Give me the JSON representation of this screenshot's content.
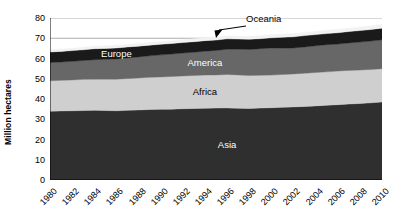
{
  "chart_data": {
    "type": "area",
    "title": "",
    "subtitle": "",
    "xlabel": "",
    "ylabel": "Million hectares",
    "stacked": true,
    "grid": true,
    "legend_position": "in-plot-labels",
    "xlim": [
      1980,
      2010
    ],
    "ylim": [
      0,
      80
    ],
    "y_ticks": [
      0,
      10,
      20,
      30,
      40,
      50,
      60,
      70,
      80
    ],
    "x_tick_labels": [
      "1980",
      "1982",
      "1984",
      "1986",
      "1988",
      "1990",
      "1992",
      "1994",
      "1996",
      "1998",
      "2000",
      "2002",
      "2004",
      "2006",
      "2008",
      "2010"
    ],
    "x_minor_tick_interval": 1,
    "x": [
      1980,
      1981,
      1982,
      1983,
      1984,
      1985,
      1986,
      1987,
      1988,
      1989,
      1990,
      1991,
      1992,
      1993,
      1994,
      1995,
      1996,
      1997,
      1998,
      1999,
      2000,
      2001,
      2002,
      2003,
      2004,
      2005,
      2006,
      2007,
      2008,
      2009,
      2010
    ],
    "series": [
      {
        "name": "Asia",
        "color": "#2f2f2f",
        "label_color": "#ffffff",
        "values": [
          34.0,
          34.1,
          34.2,
          34.3,
          34.4,
          34.3,
          34.2,
          34.4,
          34.6,
          34.8,
          34.9,
          35.0,
          35.2,
          35.3,
          35.4,
          35.5,
          35.6,
          35.4,
          35.3,
          35.5,
          35.7,
          35.9,
          36.1,
          36.3,
          36.6,
          36.9,
          37.2,
          37.5,
          37.8,
          38.1,
          38.5
        ]
      },
      {
        "name": "Africa",
        "color": "#cfcfcf",
        "label_color": "#000000",
        "values": [
          15.0,
          15.1,
          15.2,
          15.4,
          15.4,
          15.5,
          15.6,
          15.7,
          15.8,
          15.9,
          16.0,
          16.1,
          16.2,
          16.3,
          16.4,
          16.4,
          16.5,
          16.5,
          16.3,
          16.2,
          16.1,
          16.2,
          16.3,
          16.4,
          16.5,
          16.5,
          16.6,
          16.6,
          16.5,
          16.5,
          16.5
        ]
      },
      {
        "name": "America",
        "color": "#676767",
        "label_color": "#ffffff",
        "values": [
          9.0,
          9.1,
          9.2,
          9.3,
          9.6,
          9.8,
          10.0,
          10.2,
          10.4,
          10.6,
          10.9,
          11.1,
          11.3,
          11.5,
          11.8,
          12.1,
          12.5,
          12.7,
          12.9,
          13.1,
          13.4,
          13.0,
          12.8,
          13.0,
          13.2,
          13.4,
          13.3,
          13.6,
          13.8,
          14.0,
          14.2
        ]
      },
      {
        "name": "Europe",
        "color": "#1a1a1a",
        "label_color": "#ffffff",
        "values": [
          5.2,
          5.2,
          5.3,
          5.3,
          5.4,
          5.4,
          5.4,
          5.4,
          5.3,
          5.3,
          5.2,
          5.2,
          5.2,
          5.2,
          5.2,
          5.1,
          5.1,
          5.0,
          5.0,
          5.0,
          5.0,
          5.4,
          5.5,
          5.6,
          5.5,
          5.5,
          5.6,
          5.6,
          5.7,
          5.7,
          5.8
        ]
      },
      {
        "name": "Oceania",
        "color": "#f2f2f2",
        "label_color": "#000000",
        "values": [
          1.2,
          1.2,
          1.2,
          1.2,
          1.3,
          1.3,
          1.3,
          1.3,
          1.3,
          1.3,
          1.4,
          1.4,
          1.4,
          1.4,
          1.5,
          1.5,
          1.5,
          1.5,
          1.5,
          1.6,
          1.6,
          1.6,
          1.6,
          1.6,
          1.6,
          1.7,
          1.7,
          1.7,
          1.8,
          1.8,
          1.8
        ]
      }
    ],
    "annotations": [
      {
        "text": "Oceania",
        "target_series": "Oceania",
        "style": "arrow-callout"
      }
    ],
    "in_plot_labels": [
      {
        "text": "Europe",
        "series": "Europe"
      },
      {
        "text": "America",
        "series": "America"
      },
      {
        "text": "Africa",
        "series": "Africa"
      },
      {
        "text": "Asia",
        "series": "Asia"
      }
    ]
  }
}
